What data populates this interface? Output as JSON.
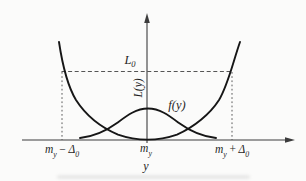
{
  "figure": {
    "background": "#fbfbfa",
    "curve_color": "#161616",
    "axis_color": "#3c3c3c",
    "dash_color": "#555555",
    "text_color": "#1f1f1f"
  },
  "labels": {
    "l0": {
      "base": "L",
      "sub": "0"
    },
    "loss_axis": "L(y)",
    "density": "f(y)",
    "x_axis": "y",
    "tick_left": {
      "p1": "m",
      "s1": "y",
      "op": "−",
      "p2": "Δ",
      "s2": "0"
    },
    "tick_center": {
      "p1": "m",
      "s1": "y"
    },
    "tick_right": {
      "p1": "m",
      "s1": "y",
      "op": "+",
      "p2": "Δ",
      "s2": "0"
    }
  },
  "geometry": {
    "x_axis_d": "M22 140 H286",
    "x_arrow_d": "M295 140 L285 137.2 L285 142.8 Z",
    "y_axis_d": "M147 143 V22",
    "y_arrow_d": "M147 13 L144.2 23 L149.8 23 Z",
    "loss_curve_d": "M59 42 C62 62 67 85 76 100 C85 114 100 127 118 134.6 C130 138.8 140 139.6 147.5 139.6 C155 139.6 165 138.8 177 134.6 C194 127.2 210 114 219 100 C228 85 233 62 240 42",
    "density_curve_d": "M80 138 C94 136.5 106 131 117 123 C127 115.5 136 108.5 148 108.5 C160 108.5 169 115.5 179 123 C190 131 202 136.5 216 138",
    "l0_line_d": "M61.5 71.5 H232",
    "left_dash_d": "M62 72 V140",
    "right_dash_d": "M232 72 V140"
  },
  "chart_data": {
    "type": "line",
    "title": "",
    "xlabel": "y",
    "ylabel": "L(y)",
    "grid": false,
    "legend_position": "none",
    "x_tick_labels": [
      "m_y − Δ_0",
      "m_y",
      "m_y + Δ_0"
    ],
    "reference_level_label": "L_0",
    "annotations": [
      "dashed horizontal line at height L_0 spanning m_y − Δ_0 to m_y + Δ_0",
      "dashed vertical lines at m_y − Δ_0 and m_y + Δ_0 from axis up to L_0",
      "L(y) written vertically along the ordinate axis",
      "f(y) labels the bell-shaped density curve"
    ],
    "x_units": "multiples of Δ_0 measured from m_y",
    "y_units": "fraction of L_0",
    "series": [
      {
        "name": "L(y)",
        "shape": "U-shaped loss curve, minimum 0 at m_y, equal to L_0 at m_y ± Δ_0",
        "x": [
          -1.04,
          -1.0,
          -0.88,
          -0.65,
          -0.47,
          -0.29,
          0.0,
          0.29,
          0.47,
          0.65,
          0.88,
          1.0,
          1.09
        ],
        "y": [
          1.43,
          1.0,
          0.58,
          0.26,
          0.15,
          0.05,
          0.0,
          0.05,
          0.15,
          0.26,
          0.58,
          1.0,
          1.43
        ]
      },
      {
        "name": "f(y)",
        "shape": "bell-shaped probability density centered at m_y",
        "x": [
          -0.79,
          -0.49,
          -0.35,
          -0.13,
          0.0,
          0.13,
          0.35,
          0.49,
          0.8
        ],
        "y": [
          0.03,
          0.15,
          0.25,
          0.44,
          0.46,
          0.44,
          0.25,
          0.15,
          0.03
        ]
      }
    ]
  }
}
